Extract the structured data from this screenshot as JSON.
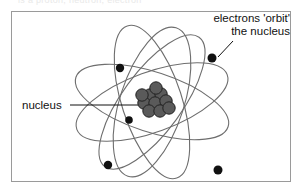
{
  "page": {
    "background_color": "#ffffff",
    "top_clipped_text": "is a proton, neutron, electron"
  },
  "figure": {
    "border_color": "#9a9a9a",
    "frame": {
      "x": 11,
      "y": 11,
      "width": 280,
      "height": 171
    },
    "callouts": [
      {
        "name": "electrons-callout",
        "line1": "electrons 'orbit'",
        "line2": "the nucleus",
        "align": "right",
        "leader": {
          "x1": 233,
          "y1": 41,
          "x2": 218,
          "y2": 57
        }
      },
      {
        "name": "nucleus-callout",
        "line1": "nucleus",
        "align": "left",
        "leader": {
          "x1": 70,
          "y1": 105,
          "x2": 142,
          "y2": 105
        }
      }
    ]
  },
  "atom": {
    "orbit_stroke": "#6e6e6e",
    "orbit_stroke_width": 1.1,
    "center": {
      "cx": 152,
      "cy": 102
    },
    "orbits": [
      {
        "name": "orbit-1",
        "rx": 80,
        "ry": 30,
        "rotation": 18
      },
      {
        "name": "orbit-2",
        "rx": 80,
        "ry": 30,
        "rotation": 72
      },
      {
        "name": "orbit-3",
        "rx": 80,
        "ry": 30,
        "rotation": 126
      },
      {
        "name": "orbit-4",
        "rx": 80,
        "ry": 30,
        "rotation": 160
      },
      {
        "name": "orbit-5",
        "rx": 78,
        "ry": 32,
        "rotation": 108
      }
    ],
    "electrons": [
      {
        "name": "electron-1",
        "cx": 120,
        "cy": 68,
        "r": 4.2
      },
      {
        "name": "electron-2",
        "cx": 212,
        "cy": 58,
        "r": 4.5
      },
      {
        "name": "electron-3",
        "cx": 129,
        "cy": 120,
        "r": 3.8
      },
      {
        "name": "electron-4",
        "cx": 108,
        "cy": 165,
        "r": 4.2
      },
      {
        "name": "electron-5",
        "cx": 218,
        "cy": 170,
        "r": 4.5
      }
    ],
    "electron_color": "#111111",
    "nucleus": {
      "fill": "#5a5a5a",
      "stroke": "#222222",
      "nucleon_radius": 6.2,
      "nucleons": [
        {
          "cx": 150,
          "cy": 95
        },
        {
          "cx": 161,
          "cy": 94
        },
        {
          "cx": 144,
          "cy": 103
        },
        {
          "cx": 155,
          "cy": 103
        },
        {
          "cx": 166,
          "cy": 101
        },
        {
          "cx": 149,
          "cy": 111
        },
        {
          "cx": 160,
          "cy": 111
        },
        {
          "cx": 169,
          "cy": 108
        },
        {
          "cx": 142,
          "cy": 95
        },
        {
          "cx": 156,
          "cy": 88
        }
      ]
    }
  }
}
